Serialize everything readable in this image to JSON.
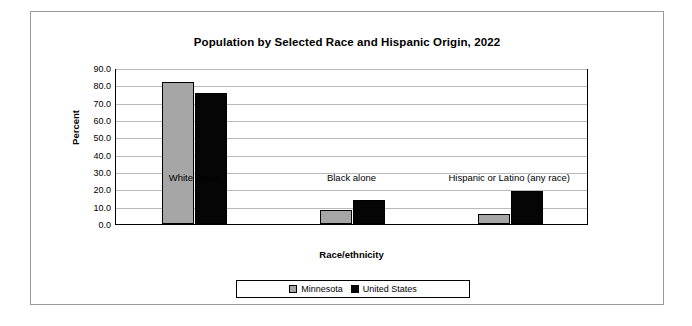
{
  "chart_data": {
    "type": "bar",
    "title": "Population by Selected Race and Hispanic Origin, 2022",
    "xlabel": "Race/ethnicity",
    "ylabel": "Percent",
    "categories": [
      "White alone",
      "Black alone",
      "Hispanic or Latino (any race)"
    ],
    "series": [
      {
        "name": "Minnesota",
        "color": "#a6a6a6",
        "values": [
          82.0,
          7.8,
          5.9
        ]
      },
      {
        "name": "United States",
        "color": "#050505",
        "values": [
          75.5,
          13.6,
          19.1
        ]
      }
    ],
    "ylim": [
      0.0,
      90.0
    ],
    "yticks": [
      "0.0",
      "10.0",
      "20.0",
      "30.0",
      "40.0",
      "50.0",
      "60.0",
      "70.0",
      "80.0",
      "90.0"
    ],
    "grid": true,
    "legend_position": "bottom"
  }
}
